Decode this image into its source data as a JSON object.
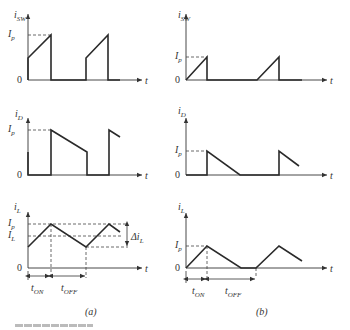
{
  "figure": {
    "panels": [
      {
        "id": "a",
        "caption": "(a)",
        "plots": [
          {
            "name": "switch-current",
            "ylabel_main": "i",
            "ylabel_sub": "SW",
            "xlabel": "t",
            "ticks": {
              "peak": "I",
              "peak_sub": "p",
              "zero": "0"
            }
          },
          {
            "name": "diode-current",
            "ylabel_main": "i",
            "ylabel_sub": "D",
            "xlabel": "t",
            "ticks": {
              "peak": "I",
              "peak_sub": "p",
              "zero": "0"
            }
          },
          {
            "name": "inductor-current",
            "ylabel_main": "i",
            "ylabel_sub": "L",
            "xlabel": "t",
            "ticks": {
              "peak": "I",
              "peak_sub": "p",
              "avg": "I",
              "avg_sub": "L",
              "zero": "0"
            },
            "ripple_label": "Δi",
            "ripple_sub": "L",
            "ton_main": "t",
            "ton_sub": "ON",
            "toff_main": "t",
            "toff_sub": "OFF"
          }
        ]
      },
      {
        "id": "b",
        "caption": "(b)",
        "plots": [
          {
            "name": "switch-current",
            "ylabel_main": "i",
            "ylabel_sub": "SW",
            "xlabel": "t",
            "ticks": {
              "peak": "I",
              "peak_sub": "p",
              "zero": "0"
            }
          },
          {
            "name": "diode-current",
            "ylabel_main": "i",
            "ylabel_sub": "D",
            "xlabel": "t",
            "ticks": {
              "peak": "I",
              "peak_sub": "p",
              "zero": "0"
            }
          },
          {
            "name": "inductor-current",
            "ylabel_main": "i",
            "ylabel_sub": "L",
            "xlabel": "t",
            "ticks": {
              "peak": "I",
              "peak_sub": "p",
              "zero": "0"
            },
            "ton_main": "t",
            "ton_sub": "ON",
            "toff_main": "t",
            "toff_sub": "OFF"
          }
        ]
      }
    ],
    "mode_description": {
      "a": "continuous conduction mode",
      "b": "discontinuous conduction mode"
    }
  }
}
